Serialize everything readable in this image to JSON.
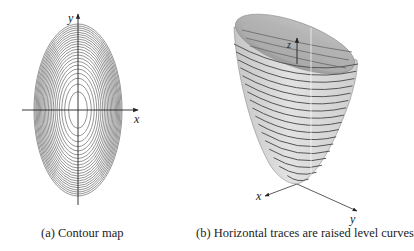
{
  "panel_a": {
    "caption": "(a) Contour map",
    "x_axis_label": "x",
    "y_axis_label": "y",
    "contour_count": 22,
    "line_color": "#7a7a7a"
  },
  "panel_b": {
    "caption": "(b) Horizontal traces are raised level curves",
    "x_axis_label": "x",
    "y_axis_label": "y",
    "z_axis_label": "z",
    "trace_count": 17,
    "surface_color": "#d4d4d4",
    "trace_color": "#555555"
  }
}
